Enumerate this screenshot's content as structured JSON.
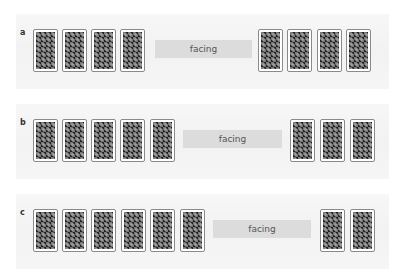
{
  "figure": {
    "colors": {
      "background": "#ffffff",
      "panel": "#f3f3f3",
      "facing_bar": "#dcdcdc",
      "card_border": "#8a8a8a",
      "card_pattern_dark": "#222222",
      "card_pattern_light": "#9a9a9a"
    },
    "panels": [
      {
        "label": "a",
        "facing_label": "facing",
        "left_cards": 4,
        "right_cards": 4
      },
      {
        "label": "b",
        "facing_label": "facing",
        "left_cards": 5,
        "right_cards": 3
      },
      {
        "label": "c",
        "facing_label": "facing",
        "left_cards": 6,
        "right_cards": 2
      }
    ]
  }
}
